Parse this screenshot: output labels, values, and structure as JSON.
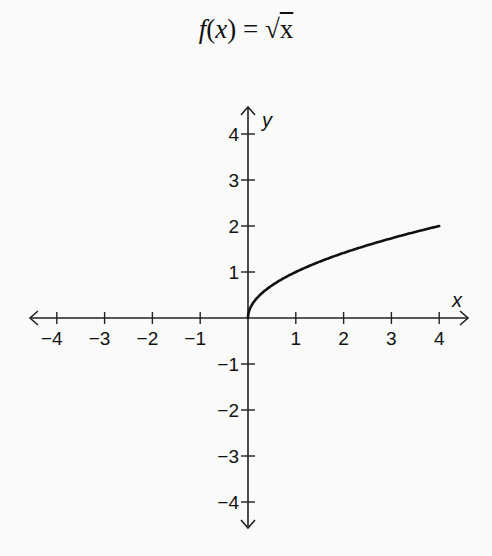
{
  "chart_data": {
    "type": "line",
    "title": "f(x) = √x",
    "title_parts": {
      "fn": "f",
      "open": "(",
      "var": "x",
      "close": ")",
      "eq": " = ",
      "radical": "√",
      "radicand": "x"
    },
    "xlabel": "x",
    "ylabel": "y",
    "xlim": [
      -4,
      4
    ],
    "ylim": [
      -4,
      4
    ],
    "grid": false,
    "legend": null,
    "x_ticks": [
      -4,
      -3,
      -2,
      -1,
      1,
      2,
      3,
      4
    ],
    "x_tick_labels": [
      "−4",
      "−3",
      "−2",
      "−1",
      "1",
      "2",
      "3",
      "4"
    ],
    "y_ticks": [
      -4,
      -3,
      -2,
      -1,
      1,
      2,
      3,
      4
    ],
    "y_tick_labels": [
      "−4",
      "−3",
      "−2",
      "−1",
      "1",
      "2",
      "3",
      "4"
    ],
    "series": [
      {
        "name": "f(x) = √x",
        "x": [
          0,
          0.05,
          0.1,
          0.25,
          0.5,
          1,
          1.5,
          2,
          2.5,
          3,
          3.5,
          4
        ],
        "y": [
          0,
          0.224,
          0.316,
          0.5,
          0.707,
          1,
          1.225,
          1.414,
          1.581,
          1.732,
          1.871,
          2
        ]
      }
    ],
    "colors": {
      "curve": "#111111",
      "axes": "#222222",
      "background": "#fafafa"
    }
  }
}
